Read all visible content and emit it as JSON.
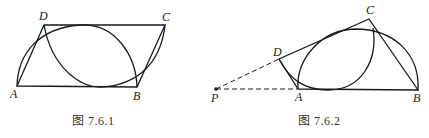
{
  "figures": [
    {
      "caption": "图 7.6.1",
      "points": {
        "A": {
          "label": "A"
        },
        "B": {
          "label": "B"
        },
        "C": {
          "label": "C"
        },
        "D": {
          "label": "D"
        }
      },
      "description": "Parallelogram ABCD with arc AB tangent to DC and arc DC tangent to AB"
    },
    {
      "caption": "图 7.6.2",
      "points": {
        "P": {
          "label": "P"
        },
        "A": {
          "label": "A"
        },
        "B": {
          "label": "B"
        },
        "C": {
          "label": "C"
        },
        "D": {
          "label": "D"
        }
      },
      "description": "Quadrilateral ABCD with dashed lines PD and PA; arc AB tangent to DC and arc DC tangent to AB"
    }
  ]
}
